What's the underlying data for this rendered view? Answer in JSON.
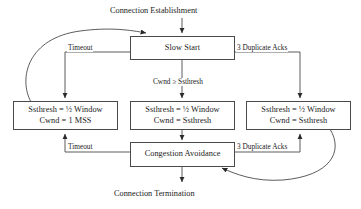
{
  "diagram": {
    "stroke_color": "#4a4a4a",
    "text_color": "#1a1a1a",
    "background": "#ffffff",
    "entry_label": "Connection Establishment",
    "exit_label": "Connection Termination",
    "nodes": {
      "slow_start": {
        "label": "Slow Start"
      },
      "timeout_left": {
        "line1": "Ssthresh = ½ Window",
        "line2": "Cwnd = 1 MSS"
      },
      "threshold_middle": {
        "line1": "Ssthresh = ½ Window",
        "line2": "Cwnd = Ssthresh"
      },
      "dupack_right": {
        "line1": "Ssthresh = ½ Window",
        "line2": "Cwnd = Ssthresh"
      },
      "congestion_avoidance": {
        "label": "Congestion Avoidance"
      }
    },
    "edge_labels": {
      "timeout_top": "Timeout",
      "dupacks_top": "3 Duplicate Acks",
      "cwnd_threshold": "Cwnd ≥ Ssthresh",
      "timeout_bottom": "Timeout",
      "dupacks_bottom": "3 Duplicate Acks"
    }
  }
}
